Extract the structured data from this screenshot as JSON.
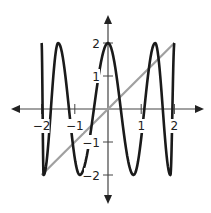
{
  "chart_data": {
    "type": "line",
    "title": "",
    "xlabel": "",
    "ylabel": "",
    "xlim": [
      -2,
      2
    ],
    "ylim": [
      -2,
      2
    ],
    "grid": false,
    "legend": null,
    "x_ticks": [
      {
        "value": -2,
        "label": "−2"
      },
      {
        "value": -1,
        "label": "−1"
      },
      {
        "value": 1,
        "label": "1"
      },
      {
        "value": 2,
        "label": "2"
      }
    ],
    "y_ticks": [
      {
        "value": 2,
        "label": "2"
      },
      {
        "value": 1,
        "label": "1"
      },
      {
        "value": -1,
        "label": "−1"
      },
      {
        "value": -2,
        "label": "−2"
      }
    ],
    "series": [
      {
        "name": "oscillating curve",
        "color": "#1a1a1a",
        "points": [
          [
            -2.0,
            2.0
          ],
          [
            -1.94,
            -2.0
          ],
          [
            -1.5,
            2.0
          ],
          [
            -0.85,
            -2.0
          ],
          [
            0.0,
            2.0
          ],
          [
            0.77,
            -2.0
          ],
          [
            1.42,
            2.0
          ],
          [
            1.88,
            -2.0
          ],
          [
            2.0,
            2.0
          ]
        ],
        "note": "extrema (peaks y=2, troughs y=-2); smooth cosine-like arcs between them"
      },
      {
        "name": "line y = x",
        "color": "#a0a0a0",
        "points": [
          [
            -2,
            -2
          ],
          [
            2,
            2
          ]
        ]
      }
    ]
  },
  "axes": {
    "color": "#333333",
    "x_axis_label_y": "",
    "y_axis_label_x": ""
  }
}
